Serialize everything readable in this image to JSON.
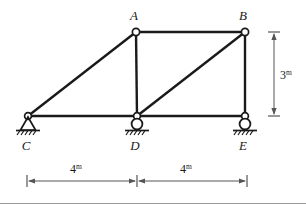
{
  "figure": {
    "type": "structural-truss-diagram",
    "line_color": "#1a1a1a",
    "dimension_color": "#555555",
    "background_color": "#ffffff"
  },
  "nodes": [
    {
      "id": "A",
      "label": "A",
      "x": 136,
      "y": 32,
      "label_x": 134,
      "label_y": 20,
      "joint": "pin-circle"
    },
    {
      "id": "B",
      "label": "B",
      "x": 245,
      "y": 32,
      "label_x": 243,
      "label_y": 20,
      "joint": "pin-circle"
    },
    {
      "id": "C",
      "label": "C",
      "x": 28,
      "y": 116,
      "label_x": 24,
      "label_y": 150,
      "joint": "pin-circle"
    },
    {
      "id": "D",
      "label": "D",
      "x": 137,
      "y": 116,
      "label_x": 133,
      "label_y": 150,
      "joint": "pin-circle"
    },
    {
      "id": "E",
      "label": "E",
      "x": 245,
      "y": 116,
      "label_x": 241,
      "label_y": 150,
      "joint": "pin-circle"
    }
  ],
  "members": [
    {
      "id": "CA",
      "from": "C",
      "to": "A"
    },
    {
      "id": "AB",
      "from": "A",
      "to": "B"
    },
    {
      "id": "AD",
      "from": "A",
      "to": "D"
    },
    {
      "id": "DB",
      "from": "D",
      "to": "B"
    },
    {
      "id": "BE",
      "from": "B",
      "to": "E"
    },
    {
      "id": "CD",
      "from": "C",
      "to": "D"
    },
    {
      "id": "DE",
      "from": "D",
      "to": "E"
    }
  ],
  "supports": [
    {
      "id": "C",
      "node": "C",
      "kind": "pin",
      "description": "pinned support with hatched ground"
    },
    {
      "id": "D",
      "node": "D",
      "kind": "roller",
      "description": "roller support with hatched ground"
    },
    {
      "id": "E",
      "node": "E",
      "kind": "roller",
      "description": "roller support with hatched ground"
    }
  ],
  "dimensions": {
    "vertical": {
      "id": "height-dim",
      "value": "3",
      "unit": "m",
      "x": 274,
      "y_top": 32,
      "y_bottom": 116,
      "label_x": 281,
      "label_y": 78
    },
    "horizontal": [
      {
        "id": "span-left-dim",
        "value": "4",
        "unit": "m",
        "x_start": 27,
        "x_end": 137,
        "y": 181,
        "label_x": 76,
        "label_y": 172
      },
      {
        "id": "span-right-dim",
        "value": "4",
        "unit": "m",
        "x_start": 137,
        "x_end": 247,
        "y": 181,
        "label_x": 186,
        "label_y": 172
      }
    ]
  },
  "footer_rule": {
    "id": "footer-divider",
    "y": 203,
    "x_start": 0,
    "x_end": 306,
    "color": "#9a9a9a"
  }
}
